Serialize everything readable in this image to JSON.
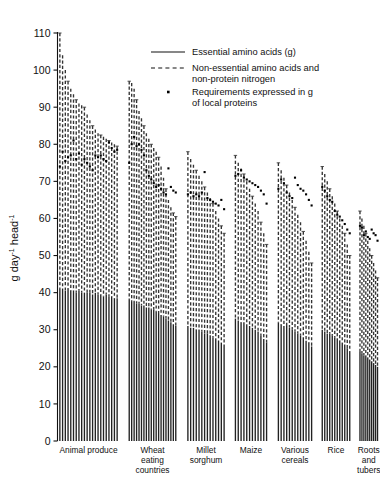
{
  "chart_data": {
    "type": "bar",
    "title": "",
    "subtitle": "",
    "xlabel": "",
    "ylabel": "g day-1 head-1",
    "ylabel_parts": {
      "g": "g",
      "day": "day",
      "day_exp": "-1",
      "head": "head",
      "head_exp": "-1"
    },
    "ylim": [
      0,
      110
    ],
    "yticks": [
      0,
      10,
      20,
      30,
      40,
      50,
      60,
      70,
      80,
      90,
      100,
      110
    ],
    "ytick_labels": [
      "0",
      "10",
      "20",
      "30",
      "40",
      "50",
      "60",
      "70",
      "80",
      "90",
      "100",
      "110"
    ],
    "grid": false,
    "legend_position": "upper-center",
    "legend": [
      {
        "marker": "solid-line",
        "label": "Essential amino acids (g)"
      },
      {
        "marker": "dashed-line",
        "label": "Non-essential amino acids and non-protein nitrogen"
      },
      {
        "marker": "dot",
        "label": "Requirements expressed in g of local proteins"
      }
    ],
    "series": [
      {
        "name": "Essential amino acids (g)",
        "style": "solid"
      },
      {
        "name": "Non-essential amino acids and non-protein nitrogen",
        "style": "dashed"
      },
      {
        "name": "Requirements expressed in g of local proteins",
        "style": "dot"
      }
    ],
    "categories": [
      "Animal produce",
      "Wheat eating countries",
      "Millet sorghum",
      "Maize",
      "Various cereals",
      "Rice",
      "Roots and tubers"
    ],
    "category_label_lines": [
      [
        "Animal produce"
      ],
      [
        "Wheat",
        "eating",
        "countries"
      ],
      [
        "Millet",
        "sorghum"
      ],
      [
        "Maize"
      ],
      [
        "Various",
        "cereals"
      ],
      [
        "Rice"
      ],
      [
        "Roots",
        "and",
        "tubers"
      ]
    ],
    "groups": [
      {
        "category": "Animal produce",
        "total": [
          110.0,
          104.0,
          100.0,
          97.0,
          95.0,
          93.5,
          92.0,
          91.0,
          90.5,
          90.0,
          88.0,
          86.5,
          85.0,
          84.0,
          83.0,
          82.5,
          82.0,
          81.5,
          81.0,
          80.5,
          80.0,
          79.5
        ],
        "essential": [
          41.0,
          41.0,
          40.5,
          41.0,
          40.5,
          40.5,
          40.0,
          40.5,
          40.0,
          40.0,
          40.0,
          40.0,
          39.5,
          40.0,
          39.5,
          39.5,
          39.0,
          39.5,
          39.0,
          39.0,
          38.5,
          38.5
        ],
        "requirement": [
          74.0,
          78.0,
          75.5,
          76.5,
          77.0,
          81.0,
          76.0,
          77.5,
          74.5,
          76.0,
          75.0,
          74.0,
          73.0,
          77.0,
          76.5,
          77.0,
          76.0,
          75.5,
          80.5,
          79.0,
          78.0,
          78.5
        ]
      },
      {
        "category": "Wheat eating countries",
        "total": [
          97.0,
          96.5,
          95.0,
          92.0,
          89.0,
          87.0,
          85.0,
          83.0,
          81.5,
          80.0,
          79.0,
          78.0,
          76.5,
          74.0,
          71.0,
          68.0,
          65.0,
          63.0,
          61.5,
          60.5
        ],
        "essential": [
          38.0,
          37.5,
          37.5,
          37.0,
          37.0,
          36.5,
          36.5,
          36.0,
          36.0,
          35.5,
          35.5,
          35.0,
          34.5,
          34.0,
          33.5,
          33.0,
          32.5,
          32.0,
          31.5,
          31.0
        ],
        "requirement": [
          75.0,
          80.0,
          82.0,
          79.5,
          80.0,
          78.5,
          77.0,
          73.0,
          71.5,
          70.5,
          69.5,
          68.5,
          69.0,
          68.0,
          67.0,
          66.5,
          73.5,
          68.5,
          67.5,
          67.0
        ]
      },
      {
        "category": "Millet sorghum",
        "total": [
          78.0,
          76.0,
          74.5,
          73.0,
          71.5,
          70.0,
          68.5,
          67.0,
          65.5,
          64.0,
          62.0,
          60.0,
          58.0,
          56.0
        ],
        "essential": [
          31.0,
          30.5,
          30.5,
          30.0,
          30.0,
          29.5,
          29.0,
          29.0,
          28.5,
          28.0,
          27.5,
          27.0,
          26.5,
          26.0
        ],
        "requirement": [
          66.5,
          67.0,
          66.0,
          66.5,
          66.0,
          67.0,
          72.5,
          65.5,
          65.0,
          64.5,
          64.0,
          63.5,
          65.0,
          62.5
        ]
      },
      {
        "category": "Maize",
        "total": [
          77.0,
          75.0,
          73.5,
          72.0,
          70.0,
          68.0,
          66.0,
          64.0,
          62.0,
          59.0,
          56.0,
          53.0
        ],
        "essential": [
          33.0,
          32.5,
          32.0,
          32.0,
          31.5,
          31.0,
          30.5,
          30.0,
          29.5,
          28.5,
          27.5,
          26.5
        ],
        "requirement": [
          71.5,
          72.0,
          73.0,
          71.0,
          70.5,
          70.0,
          69.5,
          69.0,
          68.5,
          67.5,
          66.5,
          64.0
        ]
      },
      {
        "category": "Various cereals",
        "total": [
          75.0,
          73.0,
          71.0,
          69.0,
          67.0,
          65.0,
          63.0,
          61.0,
          59.0,
          56.5,
          54.0,
          51.0,
          48.0
        ],
        "essential": [
          32.0,
          31.5,
          31.0,
          31.0,
          30.5,
          30.0,
          29.5,
          29.0,
          28.5,
          28.0,
          27.0,
          26.5,
          25.5
        ],
        "requirement": [
          68.0,
          70.5,
          69.5,
          67.0,
          66.0,
          65.5,
          71.0,
          69.0,
          68.0,
          67.5,
          66.5,
          65.0,
          63.5
        ]
      },
      {
        "category": "Rice",
        "total": [
          74.0,
          72.0,
          70.0,
          68.0,
          66.0,
          64.0,
          62.0,
          60.0,
          58.0,
          56.0,
          53.0,
          50.0
        ],
        "essential": [
          30.0,
          29.5,
          29.0,
          29.0,
          28.5,
          28.0,
          27.5,
          27.0,
          26.5,
          26.0,
          25.0,
          24.0
        ],
        "requirement": [
          68.5,
          67.5,
          66.0,
          65.0,
          64.5,
          62.0,
          61.0,
          60.5,
          59.5,
          58.5,
          57.0,
          56.0
        ]
      },
      {
        "category": "Roots and tubers",
        "total": [
          62.0,
          60.0,
          58.0,
          56.0,
          54.0,
          52.0,
          50.0,
          48.0,
          46.0,
          44.0
        ],
        "essential": [
          24.0,
          23.5,
          23.0,
          23.0,
          22.5,
          22.0,
          21.5,
          21.0,
          20.5,
          20.0
        ],
        "requirement": [
          58.0,
          57.5,
          55.5,
          56.5,
          55.0,
          54.5,
          57.0,
          56.0,
          55.5,
          54.0
        ]
      }
    ]
  },
  "colors": {
    "axis": "#111111",
    "bar_solid": "#222222",
    "bar_dashed": "#333333",
    "dot": "#000000",
    "background": "#ffffff"
  }
}
